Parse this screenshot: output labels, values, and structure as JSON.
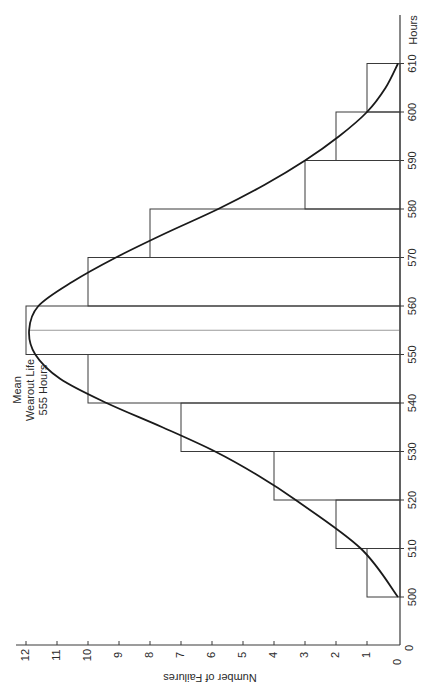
{
  "chart_data": {
    "type": "bar",
    "orientation": "rotated-90-clockwise",
    "title": "",
    "xlabel": "Hours",
    "ylabel": "Number of Failures",
    "bin_edges": [
      500,
      510,
      520,
      530,
      540,
      550,
      560,
      570,
      580,
      590,
      600,
      610
    ],
    "categories": [
      "500-510",
      "510-520",
      "520-530",
      "530-540",
      "540-550",
      "550-560",
      "560-570",
      "570-580",
      "580-590",
      "590-600",
      "600-610"
    ],
    "values": [
      1,
      2,
      4,
      7,
      10,
      12,
      10,
      8,
      3,
      2,
      1
    ],
    "x_ticks": [
      "0",
      "500",
      "510",
      "520",
      "530",
      "540",
      "550",
      "560",
      "570",
      "580",
      "590",
      "600",
      "610"
    ],
    "y_ticks": [
      "0",
      "1",
      "2",
      "3",
      "4",
      "5",
      "6",
      "7",
      "8",
      "9",
      "10",
      "11",
      "12"
    ],
    "xlim": [
      500,
      610
    ],
    "ylim": [
      0,
      12
    ],
    "overlay_curve": {
      "type": "normal",
      "mean": 555,
      "peak": 11.9,
      "points": [
        [
          500,
          0
        ],
        [
          510,
          1.2
        ],
        [
          520,
          3.3
        ],
        [
          525,
          4.5
        ],
        [
          530,
          5.9
        ],
        [
          535,
          7.6
        ],
        [
          540,
          9.4
        ],
        [
          545,
          10.9
        ],
        [
          550,
          11.7
        ],
        [
          555,
          11.9
        ],
        [
          560,
          11.6
        ],
        [
          565,
          10.5
        ],
        [
          570,
          9.1
        ],
        [
          575,
          7.5
        ],
        [
          580,
          5.8
        ],
        [
          585,
          4.3
        ],
        [
          590,
          3.0
        ],
        [
          595,
          1.9
        ],
        [
          600,
          1.0
        ],
        [
          605,
          0.4
        ],
        [
          610,
          0
        ]
      ]
    },
    "mean_line": 555,
    "annotations": [
      {
        "text_lines": [
          "Mean",
          "Wearout Life",
          "555 Hours"
        ],
        "at_hours": 555
      }
    ],
    "grid": false,
    "legend": null
  },
  "labels": {
    "x_axis_title": "Hours",
    "y_axis_title": "Number of Failures",
    "annotation_line1": "Mean",
    "annotation_line2": "Wearout Life",
    "annotation_line3": "555 Hours"
  }
}
